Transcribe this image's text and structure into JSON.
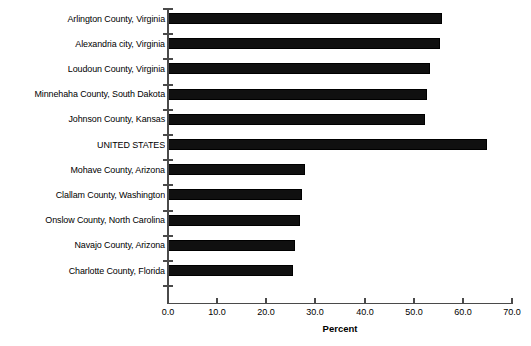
{
  "chart_data": {
    "type": "bar",
    "orientation": "horizontal",
    "title": "",
    "xlabel": "Percent",
    "ylabel": "",
    "xlim": [
      0.0,
      70.0
    ],
    "xticks": [
      "0.0",
      "10.0",
      "20.0",
      "30.0",
      "40.0",
      "50.0",
      "60.0",
      "70.0"
    ],
    "xtick_values": [
      0,
      10,
      20,
      30,
      40,
      50,
      60,
      70
    ],
    "grid": false,
    "legend": false,
    "bar_color": "#000000",
    "categories": [
      "Arlington County, Virginia",
      "Alexandria city, Virginia",
      "Loudoun County, Virginia",
      "Minnehaha County, South Dakota",
      "Johnson County, Kansas",
      "UNITED STATES",
      "Mohave County, Arizona",
      "Clallam County, Washington",
      "Onslow County, North Carolina",
      "Navajo County, Arizona",
      "Charlotte County, Florida"
    ],
    "values": [
      55.7,
      55.4,
      53.4,
      52.7,
      52.3,
      65.0,
      27.9,
      27.3,
      26.9,
      25.9,
      25.5
    ]
  }
}
